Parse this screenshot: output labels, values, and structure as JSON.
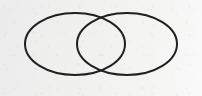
{
  "figure": {
    "kind": "venn-diagram",
    "canvas": {
      "width": 202,
      "height": 96,
      "background_color": "#f1f1f0",
      "background_color_right": "#fafafa",
      "texture": "paper-grain"
    },
    "stroke": {
      "color": "#1f1f22",
      "width": 2,
      "fill": "none",
      "linecap": "round"
    },
    "shapes": [
      {
        "name": "left-ellipse",
        "label": "A",
        "cx": 75,
        "cy": 44,
        "rx": 50,
        "ry": 31,
        "left": 25,
        "right": 125,
        "top": 13,
        "bottom": 75
      },
      {
        "name": "right-ellipse",
        "label": "B",
        "cx": 127,
        "cy": 44,
        "rx": 50,
        "ry": 31,
        "left": 77,
        "right": 177,
        "top": 13,
        "bottom": 75
      }
    ],
    "intersection": {
      "name": "overlap-region",
      "shape": "lens",
      "top_point": {
        "x": 101,
        "y": 13
      },
      "bottom_point": {
        "x": 101,
        "y": 75
      },
      "left_bound": 77,
      "right_bound": 125,
      "width": 48,
      "height": 62
    },
    "labels": []
  }
}
